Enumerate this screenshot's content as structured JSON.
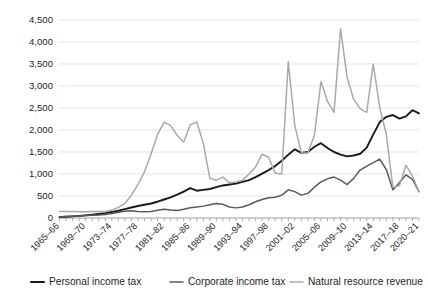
{
  "chart_data": {
    "type": "line",
    "title": "",
    "subtitle": "",
    "xlabel": "",
    "ylabel": "",
    "ylim": [
      0,
      4500
    ],
    "y_ticks": [
      0,
      500,
      1000,
      1500,
      2000,
      2500,
      3000,
      3500,
      4000,
      4500
    ],
    "y_tick_labels": [
      "0",
      "500",
      "1,000",
      "1,500",
      "2,000",
      "2,500",
      "3,000",
      "3,500",
      "4,000",
      "4,500"
    ],
    "grid": true,
    "legend_position": "bottom",
    "x_tick_labels": [
      "1965–66",
      "1969–70",
      "1973–74",
      "1977–78",
      "1981–82",
      "1985–86",
      "1989–90",
      "1993–94",
      "1997–98",
      "2001–02",
      "2005–06",
      "2009–10",
      "2013–14",
      "2017–18",
      "2020–21"
    ],
    "x_tick_indices": [
      0,
      4,
      8,
      12,
      16,
      20,
      24,
      28,
      32,
      36,
      40,
      44,
      48,
      52,
      55
    ],
    "x": [
      "1965–66",
      "1966–67",
      "1967–68",
      "1968–69",
      "1969–70",
      "1970–71",
      "1971–72",
      "1972–73",
      "1973–74",
      "1974–75",
      "1975–76",
      "1976–77",
      "1977–78",
      "1978–79",
      "1979–80",
      "1980–81",
      "1981–82",
      "1982–83",
      "1983–84",
      "1984–85",
      "1985–86",
      "1986–87",
      "1987–88",
      "1988–89",
      "1989–90",
      "1990–91",
      "1991–92",
      "1992–93",
      "1993–94",
      "1994–95",
      "1995–96",
      "1996–97",
      "1997–98",
      "1998–99",
      "1999–00",
      "2000–01",
      "2001–02",
      "2002–03",
      "2003–04",
      "2004–05",
      "2005–06",
      "2006–07",
      "2007–08",
      "2008–09",
      "2009–10",
      "2010–11",
      "2011–12",
      "2012–13",
      "2013–14",
      "2014–15",
      "2015–16",
      "2016–17",
      "2017–18",
      "2018–19",
      "2019–20",
      "2020–21"
    ],
    "series": [
      {
        "name": "Personal income tax",
        "color": "#1a1a1a",
        "width": 1.9,
        "values": [
          20,
          28,
          38,
          48,
          60,
          75,
          92,
          110,
          135,
          165,
          200,
          238,
          272,
          300,
          330,
          370,
          420,
          470,
          530,
          600,
          680,
          620,
          640,
          660,
          700,
          740,
          760,
          780,
          820,
          860,
          930,
          1010,
          1090,
          1180,
          1300,
          1440,
          1560,
          1480,
          1500,
          1620,
          1700,
          1590,
          1500,
          1440,
          1400,
          1420,
          1460,
          1600,
          1900,
          2180,
          2300,
          2340,
          2260,
          2310,
          2450,
          2380
        ]
      },
      {
        "name": "Corporate income tax",
        "color": "#58595b",
        "width": 1.5,
        "values": [
          30,
          34,
          40,
          46,
          55,
          62,
          70,
          82,
          100,
          130,
          155,
          165,
          150,
          140,
          150,
          175,
          200,
          180,
          170,
          200,
          235,
          250,
          270,
          300,
          330,
          310,
          250,
          230,
          250,
          300,
          370,
          420,
          460,
          470,
          520,
          640,
          600,
          520,
          560,
          700,
          820,
          890,
          930,
          860,
          760,
          900,
          1090,
          1180,
          1260,
          1340,
          1100,
          640,
          800,
          980,
          880,
          600
        ]
      },
      {
        "name": "Natural resource revenue",
        "color": "#a7a9ac",
        "width": 1.5,
        "values": [
          150,
          150,
          150,
          140,
          140,
          150,
          150,
          150,
          180,
          240,
          330,
          520,
          760,
          1050,
          1450,
          1900,
          2180,
          2100,
          1880,
          1720,
          2120,
          2180,
          1700,
          900,
          860,
          930,
          800,
          820,
          860,
          1000,
          1160,
          1450,
          1380,
          1020,
          1000,
          3550,
          2100,
          1480,
          1480,
          1880,
          3100,
          2650,
          2400,
          4300,
          3200,
          2700,
          2480,
          2400,
          3500,
          2500,
          1900,
          700,
          730,
          1200,
          950,
          600
        ]
      }
    ]
  },
  "legend": {
    "items": [
      {
        "label": "Personal income tax",
        "color": "#1a1a1a"
      },
      {
        "label": "Corporate income tax",
        "color": "#58595b"
      },
      {
        "label": "Natural resource revenue",
        "color": "#a7a9ac"
      }
    ]
  }
}
